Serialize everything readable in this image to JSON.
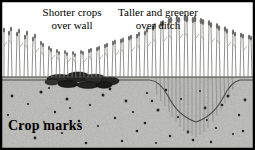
{
  "figure": {
    "title_caption": "Crop marks",
    "annotations": [
      {
        "id": "wall",
        "line1": "Shorter crops",
        "line2": "over wall"
      },
      {
        "id": "ditch",
        "line1": "Taller and greener",
        "line2": "over ditch"
      }
    ],
    "colors": {
      "border": "#000000",
      "sky": "#ffffff",
      "soil": "#b8b8b4",
      "soil_speckle": "#6e6e6a",
      "pebble": "#1e1e1e",
      "wall_stone": "#2a2a28",
      "crop_stem": "#7a7a78",
      "ground_line": "#3a3a38",
      "text": "#000000"
    },
    "scene": {
      "sky_region": {
        "x": 0,
        "y": 0,
        "width": 255,
        "height": 77
      },
      "soil_region": {
        "x": 0,
        "y": 77,
        "width": 255,
        "height": 73
      },
      "ground_surface_y": 77,
      "crop_base_line_y": 69,
      "wall": {
        "label": "buried stone wall",
        "x_start": 48,
        "x_end": 116,
        "top_y": 70,
        "bottom_y": 88
      },
      "ditch": {
        "label": "buried ditch",
        "x_start": 152,
        "x_end": 238,
        "bottom_x": 196,
        "bottom_y": 122
      }
    },
    "crop_height_profile": {
      "description": "crop canopy top (y px, smaller = taller) sampled across x",
      "x": [
        4,
        14,
        24,
        34,
        44,
        54,
        64,
        74,
        84,
        94,
        104,
        114,
        124,
        134,
        144,
        152,
        160,
        168,
        176,
        184,
        192,
        200,
        208,
        216,
        224,
        232,
        240,
        248
      ],
      "canopy_top_y": [
        30,
        29,
        32,
        36,
        44,
        50,
        52,
        53,
        52,
        50,
        47,
        44,
        41,
        38,
        34,
        28,
        24,
        21,
        20,
        19,
        20,
        21,
        23,
        26,
        29,
        31,
        34,
        36
      ]
    }
  }
}
